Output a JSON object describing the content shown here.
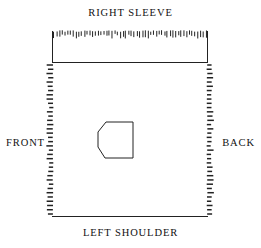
{
  "figure": {
    "kind": "garment-panel-schematic",
    "background_color": "#ffffff",
    "line_color": "#222222",
    "canvas": {
      "width": 261,
      "height": 248
    }
  },
  "labels": {
    "top": "RIGHT SLEEVE",
    "bottom": "LEFT SHOULDER",
    "left": "FRONT",
    "right": "BACK"
  },
  "geometry": {
    "body_rect": {
      "x": 52,
      "y": 62,
      "width": 156,
      "height": 154
    },
    "sleeve_bracket": {
      "left_x": 52,
      "right_x": 208,
      "top_y": 31,
      "bottom_y": 62
    },
    "center_shape": {
      "x": 98,
      "y": 122,
      "width": 35,
      "height": 36
    }
  },
  "stitch_edges": {
    "top_sleeve": {
      "edge": "top",
      "orientation": "vertical-ticks",
      "count": 56
    },
    "left_side": {
      "edge": "left",
      "orientation": "horizontal-ticks",
      "count": 36
    },
    "right_side": {
      "edge": "right",
      "orientation": "horizontal-ticks",
      "count": 36
    }
  }
}
